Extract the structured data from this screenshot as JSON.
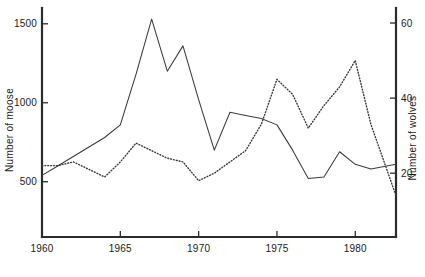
{
  "chart_data": {
    "type": "line",
    "title": "",
    "xlabel": "",
    "ylabel": "Number of moose",
    "y2label": "Number of wolves",
    "grid": false,
    "legend_position": "none",
    "xlim": [
      1960,
      1982.6
    ],
    "ylim": [
      150,
      1600
    ],
    "y2lim": [
      3,
      64
    ],
    "xticks": [
      1960,
      1965,
      1970,
      1975,
      1980
    ],
    "xtick_labels": [
      "1960",
      "1965",
      "1970",
      "1975",
      "1980"
    ],
    "yticks": [
      500,
      1000,
      1500
    ],
    "ytick_labels": [
      "500",
      "1000",
      "1500"
    ],
    "y2ticks": [
      20,
      40,
      60
    ],
    "y2tick_labels": [
      "20",
      "40",
      "60"
    ],
    "series": [
      {
        "name": "Number of moose",
        "axis": "left",
        "style": "solid",
        "color": "#3a3a3a",
        "x": [
          1960,
          1961,
          1962,
          1963,
          1964,
          1965,
          1966,
          1967,
          1968,
          1969,
          1970,
          1971,
          1972,
          1973,
          1974,
          1975,
          1976,
          1977,
          1978,
          1979,
          1980,
          1981,
          1982.6
        ],
        "values": [
          540,
          600,
          660,
          720,
          780,
          860,
          1180,
          1530,
          1200,
          1360,
          1020,
          700,
          940,
          920,
          900,
          860,
          700,
          520,
          530,
          690,
          610,
          580,
          610
        ]
      },
      {
        "name": "Number of wolves",
        "axis": "right",
        "style": "dotted",
        "color": "#3a3a3a",
        "x": [
          1960,
          1961,
          1962,
          1963,
          1964,
          1965,
          1966,
          1967,
          1968,
          1969,
          1970,
          1971,
          1972,
          1973,
          1974,
          1975,
          1976,
          1977,
          1978,
          1979,
          1980,
          1981,
          1982.6
        ],
        "values": [
          22,
          22,
          23,
          21,
          19,
          23,
          28,
          26,
          24,
          23,
          18,
          20,
          23,
          26,
          33,
          45,
          41,
          32,
          38,
          43,
          50,
          33,
          14
        ]
      }
    ]
  },
  "axes": {
    "left_title": "Number of moose",
    "right_title": "Number of wolves"
  }
}
